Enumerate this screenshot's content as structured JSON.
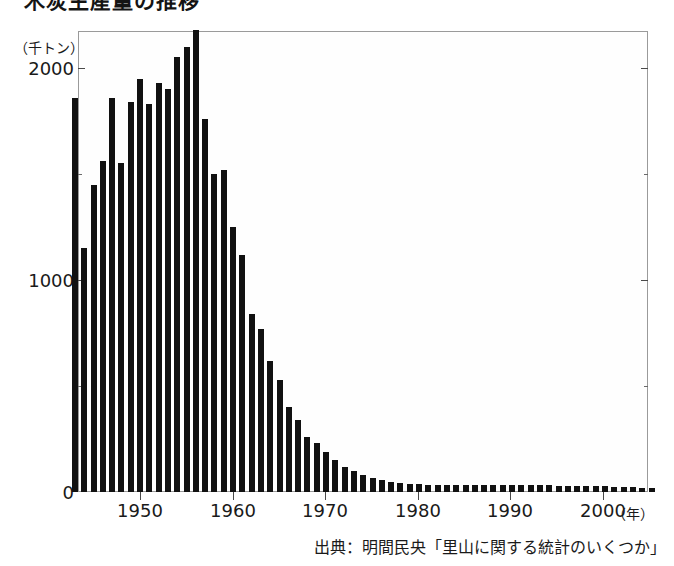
{
  "title": "木炭生産量の推移",
  "unit_label": "（千トン）",
  "source_note": "出典：明間民央「里山に関する統計のいくつか」",
  "xaxis_unit": "（年）",
  "axis": {
    "y_ticks": [
      "0",
      "1000",
      "2000"
    ],
    "x_ticks": [
      "1950",
      "1960",
      "1970",
      "1980",
      "1990",
      "2000"
    ]
  },
  "chart_data": {
    "type": "bar",
    "title": "木炭生産量の推移",
    "xlabel": "（年）",
    "ylabel": "（千トン）",
    "ylim": [
      0,
      2300
    ],
    "xlim": [
      1942.5,
      2005.5
    ],
    "grid": false,
    "legend": null,
    "bar_color": "#111111",
    "y_tick_values": [
      0,
      1000,
      2000
    ],
    "x_tick_values": [
      1950,
      1960,
      1970,
      1980,
      1990,
      2000
    ],
    "categories": [
      1943,
      1944,
      1945,
      1946,
      1947,
      1948,
      1949,
      1950,
      1951,
      1952,
      1953,
      1954,
      1955,
      1956,
      1957,
      1958,
      1959,
      1960,
      1961,
      1962,
      1963,
      1964,
      1965,
      1966,
      1967,
      1968,
      1969,
      1970,
      1971,
      1972,
      1973,
      1974,
      1975,
      1976,
      1977,
      1978,
      1979,
      1980,
      1981,
      1982,
      1983,
      1984,
      1985,
      1986,
      1987,
      1988,
      1989,
      1990,
      1991,
      1992,
      1993,
      1994,
      1995,
      1996,
      1997,
      1998,
      1999,
      2000,
      2001,
      2002,
      2003,
      2004,
      2005
    ],
    "values": [
      1860,
      1150,
      1450,
      1560,
      1860,
      1550,
      1840,
      1950,
      1830,
      1930,
      1900,
      2050,
      2100,
      2180,
      1760,
      1500,
      1520,
      1250,
      1120,
      840,
      770,
      620,
      530,
      400,
      340,
      260,
      230,
      190,
      150,
      120,
      100,
      80,
      65,
      55,
      48,
      42,
      40,
      36,
      35,
      34,
      34,
      33,
      33,
      33,
      32,
      33,
      33,
      32,
      32,
      31,
      31,
      31,
      30,
      30,
      30,
      29,
      28,
      27,
      25,
      23,
      22,
      20,
      19
    ],
    "values_unit": "千トン"
  }
}
